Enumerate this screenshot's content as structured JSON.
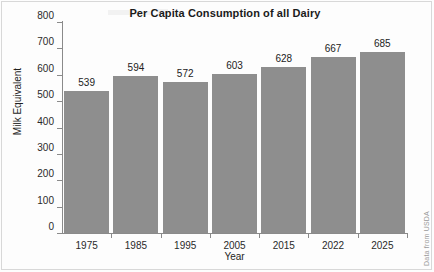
{
  "chart_data": {
    "type": "bar",
    "title": "Per Capita Consumption of all Dairy",
    "xlabel": "Year",
    "ylabel": "Milk Equivalent",
    "categories": [
      "1975",
      "1985",
      "1995",
      "2005",
      "2015",
      "2022",
      "2025"
    ],
    "values": [
      539,
      594,
      572,
      603,
      628,
      667,
      685
    ],
    "ylim": [
      0,
      800
    ],
    "yticks": [
      0,
      100,
      200,
      300,
      400,
      500,
      600,
      700,
      800
    ],
    "ytick_labels": [
      "0",
      "100",
      "200",
      "300",
      "400",
      "500",
      "600",
      "700",
      "800"
    ],
    "grid": false,
    "legend": null,
    "data_labels": true,
    "annotations": [
      "Data from USDA"
    ],
    "bar_color": "#8e8e8e",
    "axis_color": "#8a8a8a",
    "text_color": "#222222"
  },
  "source_note": "Data from USDA"
}
